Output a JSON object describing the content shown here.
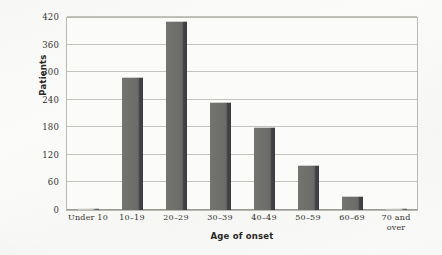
{
  "chart_data": {
    "type": "bar",
    "title": "",
    "subtitle": "",
    "xlabel": "Age of onset",
    "ylabel": "Patients",
    "categories": [
      "Under 10",
      "10–19",
      "20–29",
      "30–39",
      "40–49",
      "50–59",
      "60–69",
      "70 and over"
    ],
    "values": [
      4,
      290,
      412,
      235,
      180,
      97,
      30,
      5
    ],
    "ylim": [
      0,
      420
    ],
    "yticks": [
      0,
      60,
      120,
      180,
      240,
      300,
      360,
      420
    ],
    "ytick_labels": [
      "0",
      "60",
      "120",
      "180",
      "240",
      "300",
      "360",
      "420"
    ],
    "grid": "horizontal",
    "legend": "none",
    "series": [
      {
        "name": "Patients",
        "values": [
          4,
          290,
          412,
          235,
          180,
          97,
          30,
          5
        ]
      }
    ],
    "colors": {
      "bar_fill": "#6d6d6a",
      "bar_shadow": "#3c3c40",
      "gridline": "#c3c3bd",
      "axis": "#b9b9b4",
      "plot_background": "#fbfbfa",
      "page_background": "#f7f7f5",
      "text": "#30302a"
    }
  },
  "axes": {
    "y_title": "Patients",
    "x_title": "Age of onset",
    "x_tick_lines": [
      [
        "Under 10"
      ],
      [
        "10–19"
      ],
      [
        "20–29"
      ],
      [
        "30–39"
      ],
      [
        "40–49"
      ],
      [
        "50–59"
      ],
      [
        "60–69"
      ],
      [
        "70 and",
        "over"
      ]
    ]
  }
}
